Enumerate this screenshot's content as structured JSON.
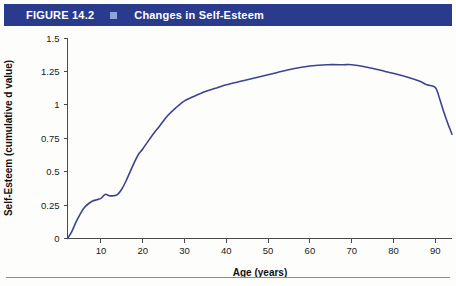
{
  "header": {
    "figure_number": "FIGURE 14.2",
    "bullet_icon": "square-bullet-icon",
    "title": "Changes in Self-Esteem",
    "band_color": "#2a3a8c",
    "bullet_color": "#8fa4d8",
    "text_color": "#ffffff"
  },
  "chart_data": {
    "type": "line",
    "title": "Changes in Self-Esteem",
    "xlabel": "Age (years)",
    "ylabel": "Self-Esteem (cumulative d value)",
    "xlim": [
      2,
      94
    ],
    "ylim": [
      0,
      1.5
    ],
    "xticks": [
      10,
      20,
      30,
      40,
      50,
      60,
      70,
      80,
      90
    ],
    "xtick_labels": [
      "10",
      "20",
      "30",
      "40",
      "50",
      "60",
      "70",
      "80",
      "90"
    ],
    "yticks": [
      0,
      0.25,
      0.5,
      0.75,
      1,
      1.25,
      1.5
    ],
    "ytick_labels": [
      "0",
      "0.25",
      "0.5",
      "0.75",
      "1",
      "1.25",
      "1.5"
    ],
    "grid": false,
    "legend": false,
    "line_color": "#3d4391",
    "series": [
      {
        "name": "Self-Esteem (cumulative d value)",
        "x": [
          2,
          3,
          4,
          5,
          6,
          7,
          8,
          9,
          10,
          11,
          12,
          13,
          14,
          15,
          16,
          17,
          18,
          19,
          20,
          22,
          24,
          26,
          28,
          30,
          32,
          35,
          38,
          40,
          44,
          48,
          52,
          56,
          60,
          64,
          68,
          70,
          74,
          78,
          82,
          86,
          88,
          90,
          91,
          92,
          93,
          94
        ],
        "y": [
          0.0,
          0.05,
          0.12,
          0.18,
          0.23,
          0.26,
          0.28,
          0.29,
          0.3,
          0.33,
          0.32,
          0.32,
          0.33,
          0.37,
          0.43,
          0.5,
          0.57,
          0.63,
          0.67,
          0.76,
          0.84,
          0.92,
          0.98,
          1.03,
          1.06,
          1.1,
          1.13,
          1.15,
          1.18,
          1.21,
          1.24,
          1.27,
          1.29,
          1.3,
          1.3,
          1.3,
          1.28,
          1.25,
          1.22,
          1.18,
          1.15,
          1.13,
          1.05,
          0.95,
          0.86,
          0.78
        ]
      }
    ]
  },
  "footer": {
    "rule_color": "#8b8b8b"
  }
}
